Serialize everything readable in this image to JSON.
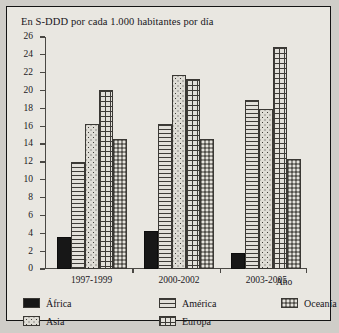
{
  "chart_data": {
    "type": "bar",
    "title": "En S-DDD por cada 1.000 habitantes por día",
    "xlabel": "Año",
    "ylabel": "",
    "ylim": [
      0,
      26
    ],
    "ytick_step": 2,
    "yticks": [
      "0",
      "2",
      "4",
      "6",
      "8",
      "10",
      "12",
      "14",
      "16",
      "18",
      "20",
      "22",
      "24",
      "26"
    ],
    "grid": false,
    "legend_position": "bottom",
    "categories": [
      "1997-1999",
      "2000-2002",
      "2003-2005"
    ],
    "series": [
      {
        "name": "África",
        "pattern": "solid-black",
        "values": [
          3.6,
          4.3,
          1.8
        ]
      },
      {
        "name": "América",
        "pattern": "horizontal-lines",
        "values": [
          12.0,
          16.2,
          18.9
        ]
      },
      {
        "name": "Asia",
        "pattern": "dots",
        "values": [
          16.2,
          21.7,
          17.9
        ]
      },
      {
        "name": "Europa",
        "pattern": "grid-crosshatch",
        "values": [
          20.1,
          21.3,
          24.9
        ]
      },
      {
        "name": "Oceanía",
        "pattern": "dark-stipple",
        "values": [
          14.6,
          14.6,
          12.3
        ]
      }
    ]
  },
  "legend": {
    "columns": [
      {
        "items": [
          "África",
          "Asia"
        ]
      },
      {
        "items": [
          "América",
          "Europa"
        ]
      },
      {
        "items": [
          "Oceanía"
        ]
      }
    ]
  },
  "colors": {
    "page_background": "#cfcdc8",
    "panel_background": "#e9e7e1",
    "frame_border": "#141414",
    "axis": "#4a4844",
    "text": "#17151a",
    "africa": "#171717",
    "oceania": "#8e8c86"
  }
}
